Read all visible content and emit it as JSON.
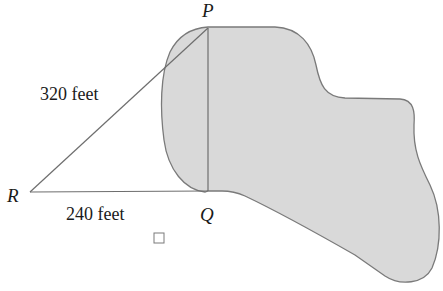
{
  "diagram": {
    "type": "geometry",
    "points": {
      "P": {
        "label": "P",
        "x": 208,
        "y": 28
      },
      "Q": {
        "label": "Q",
        "x": 208,
        "y": 191
      },
      "R": {
        "label": "R",
        "x": 30,
        "y": 192
      }
    },
    "segments": [
      {
        "from": "R",
        "to": "P",
        "length_label": "320 feet"
      },
      {
        "from": "R",
        "to": "Q",
        "length_label": "240 feet"
      },
      {
        "from": "P",
        "to": "Q",
        "length_label": ""
      }
    ],
    "labels": {
      "P": "P",
      "Q": "Q",
      "R": "R",
      "RP": "320 feet",
      "RQ": "240 feet"
    },
    "region": {
      "name": "shaded-region",
      "fill": "#d9d9d9",
      "stroke": "#7a7a7a"
    },
    "answer_checkbox": {
      "checked": false
    },
    "colors": {
      "line": "#6e6e6e",
      "fill": "#d9d9d9",
      "outline": "#7a7a7a",
      "text": "#1a1a1a"
    }
  }
}
